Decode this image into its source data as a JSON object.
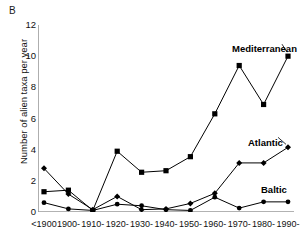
{
  "figure": {
    "panel_label": "B",
    "ylabel": "Number of alien taxa per year"
  },
  "series_labels": {
    "mediterranean": "Mediterranean",
    "atlantic": "Atlantic",
    "baltic": "Baltic"
  },
  "chart_data": {
    "type": "line",
    "title": "B",
    "xlabel": "",
    "ylabel": "Number of alien taxa per year",
    "categories": [
      "<1900",
      "1900-",
      "1910-",
      "1920-",
      "1930-",
      "1940-",
      "1950-",
      "1960-",
      "1970-",
      "1980-",
      "1990-"
    ],
    "ylim": [
      0,
      12
    ],
    "yticks": [
      0,
      2,
      4,
      6,
      8,
      10,
      12
    ],
    "grid": false,
    "legend": "inline-annotations",
    "series": [
      {
        "name": "Mediterranean",
        "marker": "square",
        "color": "#000000",
        "values": [
          1.3,
          1.4,
          0.1,
          3.9,
          2.55,
          2.65,
          3.55,
          6.3,
          9.4,
          6.9,
          10.0
        ]
      },
      {
        "name": "Atlantic",
        "marker": "diamond",
        "color": "#000000",
        "values": [
          2.8,
          1.15,
          0.15,
          1.0,
          0.15,
          0.2,
          0.55,
          1.2,
          3.15,
          3.15,
          4.15
        ]
      },
      {
        "name": "Baltic",
        "marker": "circle",
        "color": "#000000",
        "values": [
          0.6,
          0.2,
          0.1,
          0.5,
          0.4,
          0.15,
          0.1,
          0.95,
          0.25,
          0.65,
          0.65
        ]
      }
    ]
  }
}
